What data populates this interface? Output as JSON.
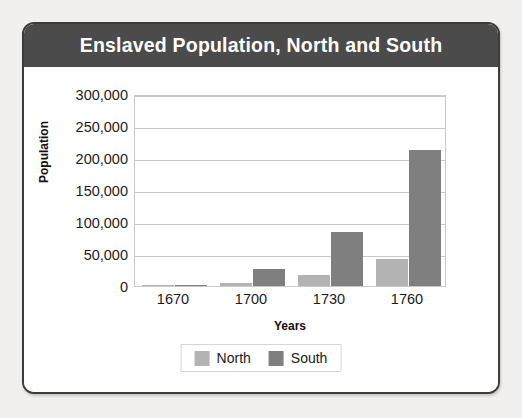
{
  "card": {
    "title": "Enslaved Population, North and South",
    "title_bar_color": "#4b4b4b",
    "border_color": "#3c3c3c",
    "background_color": "#ffffff",
    "page_background_color": "#f2f0ee"
  },
  "chart_data": {
    "type": "bar",
    "title": "Enslaved Population, North and South",
    "xlabel": "Years",
    "ylabel": "Population",
    "categories": [
      "1670",
      "1700",
      "1730",
      "1760"
    ],
    "series": [
      {
        "name": "North",
        "color": "#b3b3b3",
        "values": [
          1000,
          5000,
          17000,
          42000
        ]
      },
      {
        "name": "South",
        "color": "#7f7f7f",
        "values": [
          2000,
          26000,
          84000,
          212000
        ]
      }
    ],
    "ylim": [
      0,
      300000
    ],
    "ytick_values": [
      0,
      50000,
      100000,
      150000,
      200000,
      250000,
      300000
    ],
    "ytick_labels": [
      "0",
      "50,000",
      "100,000",
      "150,000",
      "200,000",
      "250,000",
      "300,000"
    ],
    "grid": true,
    "legend_position": "bottom",
    "legend": [
      {
        "label": "North",
        "color": "#b3b3b3"
      },
      {
        "label": "South",
        "color": "#7f7f7f"
      }
    ]
  }
}
